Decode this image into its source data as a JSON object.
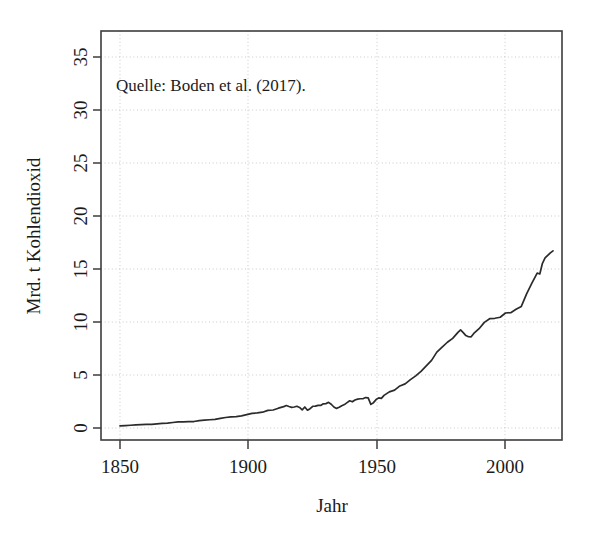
{
  "chart_data": {
    "type": "line",
    "title": "",
    "subtitle": "",
    "xlabel": "Jahr",
    "ylabel": "Mrd. t Kohlendioxid",
    "xlim": [
      1850,
      2014
    ],
    "ylim": [
      0,
      36.5
    ],
    "grid": true,
    "legend": "none",
    "annotations": [
      {
        "name": "source-note",
        "text": "Quelle: Boden et al. (2017).",
        "x": 1857,
        "y": 32.3
      }
    ],
    "x_ticks": [
      1850,
      1900,
      1950,
      2000
    ],
    "x_tick_labels": [
      "1850",
      "1900",
      "1950",
      "2000"
    ],
    "y_ticks": [
      0,
      5,
      10,
      15,
      20,
      25,
      30,
      35
    ],
    "y_tick_labels": [
      "0",
      "5",
      "10",
      "15",
      "20",
      "25",
      "30",
      "35"
    ],
    "series": [
      {
        "name": "Globale CO2-Emissionen",
        "color": "#2b2b2b",
        "x": [
          1850,
          1852,
          1854,
          1856,
          1858,
          1860,
          1862,
          1864,
          1866,
          1868,
          1870,
          1872,
          1874,
          1876,
          1878,
          1880,
          1882,
          1884,
          1886,
          1888,
          1890,
          1892,
          1894,
          1896,
          1898,
          1900,
          1902,
          1904,
          1906,
          1908,
          1910,
          1912,
          1913,
          1914,
          1915,
          1916,
          1917,
          1918,
          1919,
          1920,
          1921,
          1922,
          1923,
          1924,
          1925,
          1926,
          1927,
          1928,
          1929,
          1930,
          1931,
          1932,
          1933,
          1934,
          1935,
          1936,
          1937,
          1938,
          1939,
          1940,
          1941,
          1942,
          1943,
          1944,
          1945,
          1946,
          1947,
          1948,
          1949,
          1950,
          1952,
          1954,
          1956,
          1958,
          1960,
          1962,
          1964,
          1966,
          1968,
          1970,
          1972,
          1974,
          1976,
          1978,
          1979,
          1980,
          1981,
          1982,
          1983,
          1984,
          1986,
          1988,
          1990,
          1992,
          1994,
          1996,
          1998,
          2000,
          2002,
          2004,
          2006,
          2008,
          2009,
          2010,
          2011,
          2012,
          2013,
          2014
        ],
        "y": [
          0.2,
          0.23,
          0.26,
          0.29,
          0.31,
          0.34,
          0.35,
          0.39,
          0.43,
          0.46,
          0.52,
          0.58,
          0.58,
          0.61,
          0.61,
          0.7,
          0.75,
          0.78,
          0.81,
          0.9,
          0.99,
          1.05,
          1.08,
          1.14,
          1.26,
          1.38,
          1.42,
          1.49,
          1.66,
          1.7,
          1.87,
          2.02,
          2.12,
          2.03,
          1.95,
          1.98,
          2.05,
          1.94,
          1.71,
          1.98,
          1.68,
          1.82,
          2.05,
          2.06,
          2.14,
          2.13,
          2.28,
          2.3,
          2.42,
          2.24,
          1.98,
          1.85,
          1.95,
          2.1,
          2.21,
          2.39,
          2.57,
          2.47,
          2.64,
          2.72,
          2.76,
          2.76,
          2.87,
          2.84,
          2.23,
          2.39,
          2.68,
          2.84,
          2.8,
          3.08,
          3.41,
          3.57,
          3.97,
          4.16,
          4.56,
          4.92,
          5.35,
          5.86,
          6.38,
          7.16,
          7.63,
          8.09,
          8.46,
          9.02,
          9.25,
          9.0,
          8.72,
          8.61,
          8.6,
          8.92,
          9.37,
          9.96,
          10.31,
          10.35,
          10.45,
          10.85,
          10.88,
          11.2,
          11.47,
          12.65,
          13.67,
          14.62,
          14.53,
          15.54,
          16.04,
          16.28,
          16.52,
          16.71
        ]
      }
    ],
    "note": "y-Werte in Mrd. t Kohlendioxid; Kurve entspricht den dargestellten Werten von 0 bis 36."
  },
  "axes": {
    "x_axis_title": "Jahr",
    "y_axis_title": "Mrd. t Kohlendioxid"
  },
  "annotation": {
    "source": "Quelle: Boden et al. (2017)."
  }
}
